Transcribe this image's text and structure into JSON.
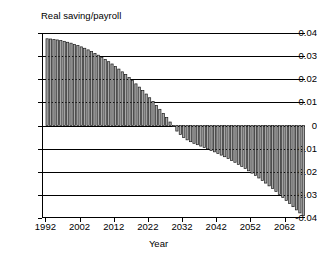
{
  "chart_data": {
    "type": "bar",
    "title": "",
    "ylabel": "Real saving/payroll",
    "xlabel": "Year",
    "ylim": [
      -0.04,
      0.04
    ],
    "xlim": [
      1991,
      2068
    ],
    "grid": true,
    "legend": null,
    "ytick_labels": [
      "0.04",
      "0.03",
      "0.02",
      "0.01",
      "0",
      "-0.01",
      "-0.02",
      "-0.03",
      "-0.04"
    ],
    "ytick_values": [
      0.04,
      0.03,
      0.02,
      0.01,
      0,
      -0.01,
      -0.02,
      -0.03,
      -0.04
    ],
    "xtick_labels": [
      "1992",
      "2002",
      "2012",
      "2022",
      "2032",
      "2042",
      "2052",
      "2062"
    ],
    "xtick_values": [
      1992,
      2002,
      2012,
      2022,
      2032,
      2042,
      2052,
      2062
    ],
    "bar_color": "#a8a8a8",
    "bar_edge_color": "#1a1a1a",
    "categories": [
      1992,
      1993,
      1994,
      1995,
      1996,
      1997,
      1998,
      1999,
      2000,
      2001,
      2002,
      2003,
      2004,
      2005,
      2006,
      2007,
      2008,
      2009,
      2010,
      2011,
      2012,
      2013,
      2014,
      2015,
      2016,
      2017,
      2018,
      2019,
      2020,
      2021,
      2022,
      2023,
      2024,
      2025,
      2026,
      2027,
      2028,
      2029,
      2030,
      2031,
      2032,
      2033,
      2034,
      2035,
      2036,
      2037,
      2038,
      2039,
      2040,
      2041,
      2042,
      2043,
      2044,
      2045,
      2046,
      2047,
      2048,
      2049,
      2050,
      2051,
      2052,
      2053,
      2054,
      2055,
      2056,
      2057,
      2058,
      2059,
      2060,
      2061,
      2062,
      2063,
      2064,
      2065,
      2066,
      2067
    ],
    "values": [
      0.0375,
      0.0374,
      0.0372,
      0.037,
      0.0367,
      0.0364,
      0.036,
      0.0356,
      0.0351,
      0.0346,
      0.034,
      0.0334,
      0.0327,
      0.032,
      0.0312,
      0.0304,
      0.0295,
      0.0286,
      0.0276,
      0.0266,
      0.0255,
      0.0244,
      0.0232,
      0.022,
      0.0207,
      0.0194,
      0.018,
      0.0166,
      0.0151,
      0.0136,
      0.012,
      0.0104,
      0.0087,
      0.007,
      0.0052,
      0.0034,
      0.0015,
      -0.0004,
      -0.0024,
      -0.0039,
      -0.0052,
      -0.0062,
      -0.007,
      -0.0077,
      -0.0083,
      -0.0089,
      -0.0095,
      -0.0101,
      -0.0108,
      -0.0114,
      -0.0121,
      -0.0128,
      -0.0135,
      -0.0143,
      -0.0151,
      -0.0159,
      -0.0168,
      -0.0177,
      -0.0186,
      -0.0196,
      -0.0206,
      -0.0216,
      -0.0227,
      -0.0238,
      -0.0249,
      -0.0261,
      -0.0273,
      -0.0285,
      -0.0298,
      -0.0311,
      -0.0324,
      -0.0337,
      -0.0351,
      -0.0365,
      -0.0378,
      -0.039
    ]
  }
}
